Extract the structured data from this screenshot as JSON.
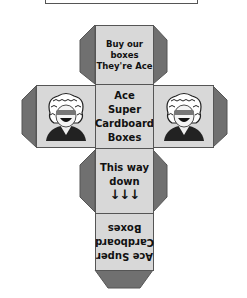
{
  "diagram": {
    "type": "cube-net",
    "colors": {
      "face_fill": "#d8d8d8",
      "tab_fill": "#707070",
      "outline": "#555555",
      "background": "#ffffff"
    },
    "faces": {
      "top": {
        "line1": "Buy our boxes",
        "line2": "They're Ace"
      },
      "center": {
        "line1": "Ace Super",
        "line2": "Cardboard",
        "line3": "Boxes"
      },
      "left": {
        "image": "mascot-with-sunglasses"
      },
      "right": {
        "image": "mascot-with-sunglasses"
      },
      "down": {
        "line1": "This way",
        "line2": "down",
        "arrows": "↓↓↓"
      },
      "bottom": {
        "line1": "Ace Super",
        "line2": "Cardboard",
        "line3": "Boxes",
        "orientation": "upside-down"
      }
    }
  }
}
